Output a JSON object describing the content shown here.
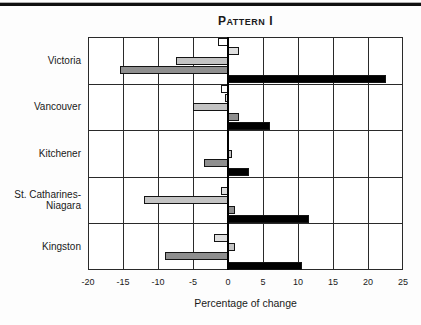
{
  "title_parts": {
    "lead": "P",
    "small": "ATTERN",
    "tail": "I"
  },
  "chart_data": {
    "type": "bar",
    "orientation": "horizontal",
    "xlabel": "Percentage of change",
    "xlim": [
      -20,
      25
    ],
    "xticks": [
      -20,
      -15,
      -10,
      -5,
      0,
      5,
      10,
      15,
      20,
      25
    ],
    "grid": "on",
    "legend": "none",
    "categories": [
      "Victoria",
      "Vancouver",
      "Kitchener",
      "St. Catharines-Niagara",
      "Kingston"
    ],
    "category_lines": [
      [
        "Victoria"
      ],
      [
        "Vancouver"
      ],
      [
        "Kitchener"
      ],
      [
        "St. Catharines-",
        "Niagara"
      ],
      [
        "Kingston"
      ]
    ],
    "series": [
      {
        "name": "series-1-white",
        "color": "#ffffff",
        "values": [
          -1.5,
          -1,
          0,
          0,
          0
        ]
      },
      {
        "name": "series-2-light-gray",
        "color": "#dedede",
        "values": [
          1.5,
          -0.5,
          0,
          -1,
          -2
        ]
      },
      {
        "name": "series-3-medium-gray",
        "color": "#c3c3c3",
        "values": [
          -7.5,
          -5,
          0.5,
          -12,
          1
        ]
      },
      {
        "name": "series-4-dark-gray",
        "color": "#8f8f8f",
        "values": [
          -15.5,
          1.5,
          -3.5,
          1,
          -9
        ]
      },
      {
        "name": "series-5-black",
        "color": "#000000",
        "values": [
          22.5,
          6,
          3,
          11.5,
          10.5
        ]
      }
    ]
  }
}
